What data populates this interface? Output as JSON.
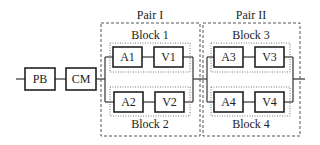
{
  "diagram": {
    "type": "reliability-block-diagram",
    "colors": {
      "line": "#333333",
      "dashed": "#555555",
      "dotted": "#777777",
      "background": "#ffffff"
    },
    "series_components": [
      {
        "id": "pb",
        "label": "PB"
      },
      {
        "id": "cm",
        "label": "CM"
      }
    ],
    "pairs": [
      {
        "label": "Pair I",
        "blocks": [
          {
            "label": "Block 1",
            "components": [
              "A1",
              "V1"
            ]
          },
          {
            "label": "Block 2",
            "components": [
              "A2",
              "V2"
            ]
          }
        ]
      },
      {
        "label": "Pair II",
        "blocks": [
          {
            "label": "Block 3",
            "components": [
              "A3",
              "V3"
            ]
          },
          {
            "label": "Block 4",
            "components": [
              "A4",
              "V4"
            ]
          }
        ]
      }
    ]
  }
}
